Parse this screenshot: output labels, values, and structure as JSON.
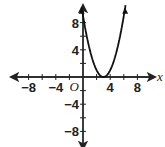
{
  "chart_data": {
    "type": "line",
    "title": "",
    "xlabel": "x",
    "ylabel": "",
    "origin_label": "O",
    "xlim": [
      -10,
      10
    ],
    "ylim": [
      -10,
      10
    ],
    "x_tick_step": 2,
    "y_tick_step": 2,
    "x_tick_labels": [
      "-8",
      "-4",
      "4",
      "8"
    ],
    "y_tick_labels": [
      "8",
      "4",
      "-4",
      "-8"
    ],
    "grid": false,
    "series": [
      {
        "name": "y = (x - 3)^2",
        "x": [
          0,
          1,
          2,
          3,
          4,
          5,
          6
        ],
        "y": [
          9,
          4,
          1,
          0,
          1,
          4,
          9
        ]
      }
    ]
  }
}
